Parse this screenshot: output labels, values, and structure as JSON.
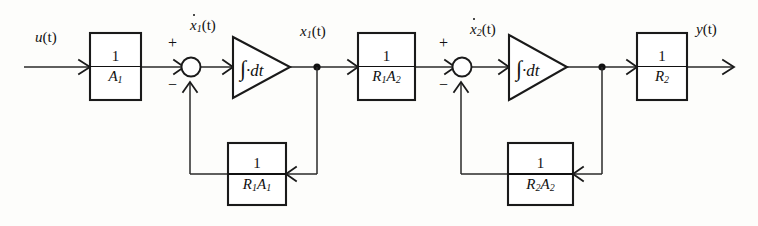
{
  "diagram": {
    "background_color": "#fdfdfb",
    "line_color": "#1a1a1a",
    "signals": {
      "input": "u(t)",
      "state1_dot": "ẋ1(t)",
      "state1": "x1(t)",
      "state2_dot": "ẋ2(t)",
      "output": "y(t)"
    },
    "labels": {
      "input_base": "u",
      "input_arg": "(t)",
      "x1dot_base": "x",
      "x1dot_sub": "1",
      "x1dot_arg": "(t)",
      "x1_base": "x",
      "x1_sub": "1",
      "x1_arg": "(t)",
      "x2dot_base": "x",
      "x2dot_sub": "2",
      "x2dot_arg": "(t)",
      "y_base": "y",
      "y_arg": "(t)"
    },
    "blocks": [
      {
        "id": "gain-1-over-A1",
        "numerator": "1",
        "denominator": "A",
        "denominator_sub": "1",
        "text": "1/A1"
      },
      {
        "id": "gain-1-over-R1A2",
        "numerator": "1",
        "denominator": "R",
        "denominator_sub": "1",
        "denominator2": "A",
        "denominator2_sub": "2",
        "text": "1/(R1A2)"
      },
      {
        "id": "gain-1-over-R2",
        "numerator": "1",
        "denominator": "R",
        "denominator_sub": "2",
        "text": "1/R2"
      },
      {
        "id": "feedback-1-over-R1A1",
        "numerator": "1",
        "denominator": "R",
        "denominator_sub": "1",
        "denominator2": "A",
        "denominator2_sub": "1",
        "text": "1/(R1A1)"
      },
      {
        "id": "feedback-1-over-R2A2",
        "numerator": "1",
        "denominator": "R",
        "denominator_sub": "2",
        "denominator2": "A",
        "denominator2_sub": "2",
        "text": "1/(R2A2)"
      }
    ],
    "integrators": [
      {
        "id": "integrator-1",
        "symbol": "∫",
        "body": "·dt"
      },
      {
        "id": "integrator-2",
        "symbol": "∫",
        "body": "·dt"
      }
    ],
    "summing_junctions": [
      {
        "id": "summing-junction-1",
        "plus": "+",
        "minus": "−"
      },
      {
        "id": "summing-junction-2",
        "plus": "+",
        "minus": "−"
      }
    ]
  }
}
